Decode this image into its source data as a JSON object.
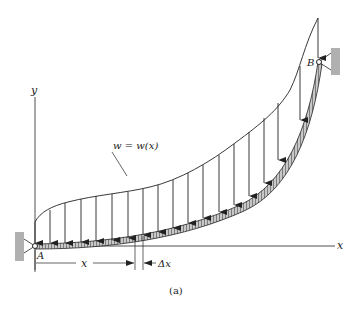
{
  "figure": {
    "caption": "(a)",
    "labels": {
      "y_axis": "y",
      "x_axis": "x",
      "point_a": "A",
      "point_b": "B",
      "load_function": "w = w(x)",
      "distance": "x",
      "increment": "Δx"
    },
    "colors": {
      "line": "#222222",
      "support": "#b0b0b0",
      "beam_fill": "#9a9a9a"
    }
  }
}
